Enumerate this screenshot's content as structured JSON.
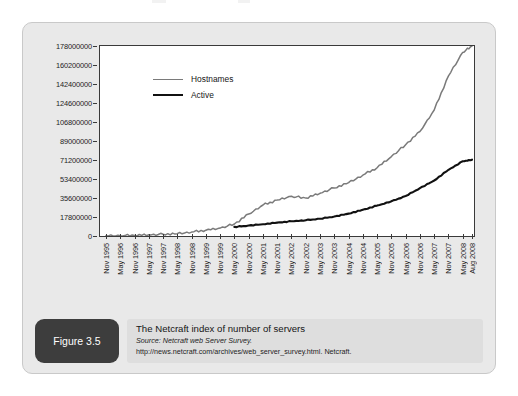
{
  "figure": {
    "badge_label": "Figure 3.5",
    "caption_title": "The Netcraft index of number of servers",
    "caption_source": "Source: Netcraft web Server Survey.",
    "caption_url": "http://news.netcraft.com/archives/web_server_survey.html. Netcraft."
  },
  "legend": {
    "hostnames_label": "Hostnames",
    "active_label": "Active"
  },
  "colors": {
    "hostnames_line": "#7a7a7a",
    "active_line": "#111111",
    "panel_bg": "#e9e9e9",
    "plot_bg": "#ffffff",
    "axis": "#3a3a3a",
    "badge_bg": "#3d3d3d"
  },
  "chart_data": {
    "type": "line",
    "title": "The Netcraft index of number of servers",
    "xlabel": "",
    "ylabel": "",
    "grid": false,
    "legend_position": "top-left",
    "ylim": [
      0,
      178000000
    ],
    "ytick_labels": [
      "0",
      "17800000",
      "35600000",
      "53400000",
      "71200000",
      "89000000",
      "106800000",
      "124600000",
      "142400000",
      "160200000",
      "178000000"
    ],
    "ytick_values": [
      0,
      17800000,
      35600000,
      53400000,
      71200000,
      89000000,
      106800000,
      124600000,
      142400000,
      160200000,
      178000000
    ],
    "categories": [
      "Nov 1995",
      "May 1996",
      "Nov 1996",
      "May 1997",
      "Nov 1997",
      "May 1998",
      "Nov 1998",
      "May 1999",
      "Nov 1999",
      "May 2000",
      "Nov 2000",
      "May 2001",
      "Nov 2001",
      "May 2002",
      "Nov 2002",
      "May 2003",
      "Nov 2003",
      "May 2004",
      "Nov 2004",
      "May 2005",
      "Nov 2005",
      "May 2006",
      "Nov 2006",
      "May 2007",
      "Nov 2007",
      "May 2008",
      "Aug 2008"
    ],
    "series": [
      {
        "name": "Hostnames",
        "color": "#7a7a7a",
        "values": [
          200000,
          300000,
          600000,
          1100000,
          1600000,
          2200000,
          3700000,
          5400000,
          7400000,
          11200000,
          20600000,
          29000000,
          33600000,
          37200000,
          35500000,
          40000000,
          45000000,
          50000000,
          57000000,
          64000000,
          74400000,
          85500000,
          97900000,
          118000000,
          150000000,
          172000000,
          178000000
        ]
      },
      {
        "name": "Active",
        "color": "#111111",
        "values": [
          null,
          null,
          null,
          null,
          null,
          null,
          null,
          null,
          null,
          8500000,
          9800000,
          11000000,
          12600000,
          13800000,
          14800000,
          16200000,
          18200000,
          21000000,
          24500000,
          28500000,
          32500000,
          37500000,
          44800000,
          52000000,
          62000000,
          70000000,
          71500000
        ]
      }
    ]
  }
}
